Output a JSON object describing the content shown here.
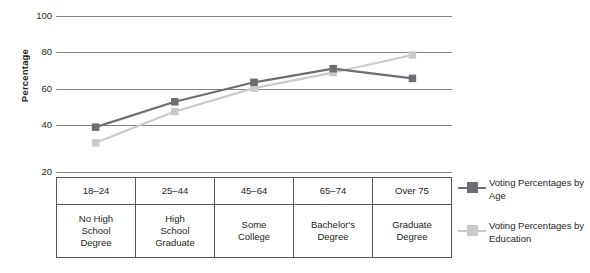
{
  "chart_data": {
    "type": "line",
    "title": "",
    "xlabel": "",
    "ylabel": "Percentage",
    "ylim": [
      20,
      100
    ],
    "yticks": [
      100,
      80,
      60,
      40,
      20
    ],
    "grid": true,
    "legend_position": "right",
    "categories": [
      "18–24",
      "25–44",
      "45–64",
      "65–74",
      "Over 75"
    ],
    "categories_secondary": [
      "No High School Degree",
      "High School Graduate",
      "Some College",
      "Bachelor's Degree",
      "Graduate Degree"
    ],
    "series": [
      {
        "name": "Voting Percentages by Age",
        "color": "#6d6e71",
        "values": [
          43,
          56,
          66,
          73,
          68
        ]
      },
      {
        "name": "Voting Percentages by Education",
        "color": "#c9cacc",
        "values": [
          35,
          51,
          63,
          71,
          80
        ]
      }
    ]
  },
  "axis": {
    "y_title": "Percentage",
    "y_tick_labels": [
      "100",
      "80",
      "60",
      "40",
      "20"
    ]
  },
  "table": {
    "age_row": [
      "18–24",
      "25–44",
      "45–64",
      "65–74",
      "Over 75"
    ],
    "education_row": [
      "No High\nSchool\nDegree",
      "High\nSchool\nGraduate",
      "Some\nCollege",
      "Bachelor's\nDegree",
      "Graduate\nDegree"
    ]
  },
  "legend": {
    "entries": [
      {
        "label": "Voting Percentages by Age",
        "color": "#6d6e71",
        "marker": "square-marker"
      },
      {
        "label": "Voting Percentages by Education",
        "color": "#c9cacc",
        "marker": "square-marker"
      }
    ]
  },
  "colors": {
    "series_age": "#6d6e71",
    "series_education": "#c9cacc",
    "gridline": "#808285",
    "table_border": "#58595b",
    "text": "#231f20"
  }
}
